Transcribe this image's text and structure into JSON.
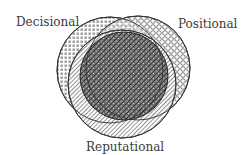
{
  "diagram": {
    "type": "venn",
    "sets": [
      {
        "id": "decisional",
        "label": "Decisional",
        "pattern": "square-grid",
        "cx": 110,
        "cy": 70,
        "r": 53
      },
      {
        "id": "positional",
        "label": "Positional",
        "pattern": "open-circles",
        "cx": 138,
        "cy": 68,
        "r": 52
      },
      {
        "id": "reputational",
        "label": "Reputational",
        "pattern": "diagonal-hatch",
        "cx": 122,
        "cy": 84,
        "r": 54
      }
    ],
    "intersection": {
      "pattern": "dark-crosshatch",
      "cx": 124,
      "cy": 76,
      "r": 44
    },
    "colors": {
      "stroke": "#333333",
      "pattern_ink": "#555555",
      "dark_fill": "#6a6a6a",
      "text": "#3a3a3a"
    }
  }
}
